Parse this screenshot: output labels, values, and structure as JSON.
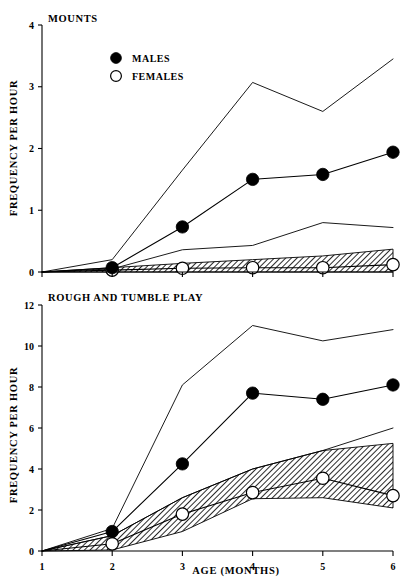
{
  "figure": {
    "xlabel": "AGE  (MONTHS)",
    "ylabel": "FREQUENCY PER HOUR",
    "legend": {
      "males_label": "MALES",
      "females_label": "FEMALES",
      "male_marker": "filled-circle",
      "female_marker": "open-circle"
    },
    "colors": {
      "ink": "#000000",
      "background": "#ffffff",
      "band_hatch": "#808080"
    }
  },
  "panels": [
    {
      "id": "mounts",
      "title": "MOUNTS",
      "ylabel": "FREQUENCY PER HOUR",
      "yticks": [
        "0",
        "1",
        "2",
        "3",
        "4"
      ],
      "xticks": [
        "1",
        "2",
        "3",
        "4",
        "5",
        "6"
      ]
    },
    {
      "id": "rough-and-tumble-play",
      "title": "ROUGH AND TUMBLE PLAY",
      "ylabel": "FREQUENCY PER HOUR",
      "yticks": [
        "0",
        "2",
        "4",
        "6",
        "8",
        "10",
        "12"
      ],
      "xticks": [
        "1",
        "2",
        "3",
        "4",
        "5",
        "6"
      ]
    }
  ],
  "chart_data": [
    {
      "type": "line",
      "id": "mounts",
      "title": "MOUNTS",
      "xlabel": "AGE (MONTHS)",
      "ylabel": "FREQUENCY PER HOUR",
      "x": [
        1,
        2,
        3,
        4,
        5,
        6
      ],
      "xlim": [
        1,
        6
      ],
      "ylim": [
        0,
        4
      ],
      "yticks": [
        0,
        1,
        2,
        3,
        4
      ],
      "xticks": [
        1,
        2,
        3,
        4,
        5,
        6
      ],
      "grid": false,
      "legend": [
        "MALES",
        "FEMALES"
      ],
      "legend_position": "upper-left-inside",
      "series": [
        {
          "name": "MALES",
          "marker": "filled-circle",
          "values": [
            0.0,
            0.07,
            0.73,
            1.5,
            1.58,
            1.94
          ]
        },
        {
          "name": "MALES upper envelope",
          "marker": "none",
          "values": [
            0.0,
            0.2,
            1.65,
            3.07,
            2.6,
            3.45
          ]
        },
        {
          "name": "MALES lower envelope",
          "marker": "none",
          "values": [
            0.0,
            0.05,
            0.36,
            0.43,
            0.8,
            0.72
          ]
        },
        {
          "name": "FEMALES",
          "marker": "open-circle",
          "values": [
            0.0,
            0.03,
            0.06,
            0.07,
            0.07,
            0.12
          ]
        },
        {
          "name": "FEMALES band upper",
          "marker": "none",
          "values": [
            0.0,
            0.07,
            0.14,
            0.2,
            0.26,
            0.37
          ]
        },
        {
          "name": "FEMALES band lower",
          "marker": "none",
          "values": [
            0.0,
            0.0,
            0.0,
            0.0,
            0.0,
            0.0
          ]
        }
      ]
    },
    {
      "type": "line",
      "id": "rough-and-tumble-play",
      "title": "ROUGH AND TUMBLE PLAY",
      "xlabel": "AGE (MONTHS)",
      "ylabel": "FREQUENCY PER HOUR",
      "x": [
        1,
        2,
        3,
        4,
        5,
        6
      ],
      "xlim": [
        1,
        6
      ],
      "ylim": [
        0,
        12
      ],
      "yticks": [
        0,
        2,
        4,
        6,
        8,
        10,
        12
      ],
      "xticks": [
        1,
        2,
        3,
        4,
        5,
        6
      ],
      "grid": false,
      "legend": [
        "MALES",
        "FEMALES"
      ],
      "legend_position": "none",
      "series": [
        {
          "name": "MALES",
          "marker": "filled-circle",
          "values": [
            0.0,
            0.95,
            4.25,
            7.7,
            7.4,
            8.1
          ]
        },
        {
          "name": "MALES upper envelope",
          "marker": "none",
          "values": [
            0.0,
            1.1,
            8.1,
            11.0,
            10.25,
            10.8
          ]
        },
        {
          "name": "MALES lower envelope",
          "marker": "none",
          "values": [
            0.0,
            0.75,
            2.6,
            4.0,
            4.9,
            6.0
          ]
        },
        {
          "name": "FEMALES",
          "marker": "open-circle",
          "values": [
            0.0,
            0.35,
            1.8,
            2.85,
            3.55,
            2.7
          ]
        },
        {
          "name": "FEMALES band upper",
          "marker": "none",
          "values": [
            0.0,
            0.75,
            2.6,
            4.0,
            4.9,
            5.25
          ]
        },
        {
          "name": "FEMALES band lower",
          "marker": "none",
          "values": [
            0.0,
            0.05,
            0.95,
            2.55,
            2.6,
            2.1
          ]
        }
      ]
    }
  ]
}
